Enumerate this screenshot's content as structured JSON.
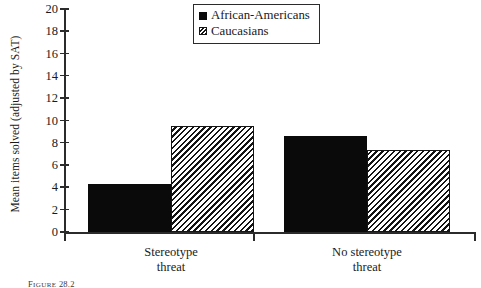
{
  "chart_data": {
    "type": "bar",
    "title": "",
    "xlabel": "",
    "ylabel": "Mean items solved (adjusted by SAT)",
    "ylim": [
      0,
      20
    ],
    "yticks": [
      0,
      2,
      4,
      6,
      8,
      10,
      12,
      14,
      16,
      18,
      20
    ],
    "grid": false,
    "legend_position": "top-center",
    "categories": [
      "Stereotype threat",
      "No stereotype threat"
    ],
    "category_lines": [
      [
        "Stereotype",
        "threat"
      ],
      [
        "No  stereotype",
        "threat"
      ]
    ],
    "series": [
      {
        "name": "African-Americans",
        "fill": "solid",
        "color": "#0a0a0a",
        "values": [
          4.3,
          8.6
        ]
      },
      {
        "name": "Caucasians",
        "fill": "hatched",
        "color": "#141414",
        "values": [
          9.5,
          7.4
        ]
      }
    ]
  },
  "legend": {
    "items": [
      {
        "label": "African-Americans",
        "marker": "solid-square-icon"
      },
      {
        "label": "Caucasians",
        "marker": "hatched-square-icon"
      }
    ]
  },
  "caption": {
    "prefix": "F",
    "word": "IGURE",
    "number": " 28.2"
  }
}
